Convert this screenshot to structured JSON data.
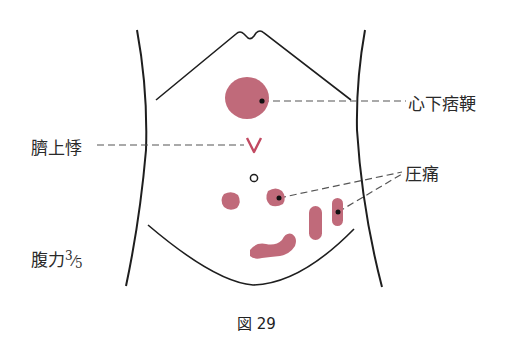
{
  "figure": {
    "caption": "図 29",
    "colors": {
      "finding_fill": "#c06a7a",
      "outline": "#1e1e1e",
      "leader_line": "#555555",
      "mark": "#c24a62"
    },
    "labels": {
      "shinka_hiko": "心下痞鞕",
      "seijo_ki": "臍上悸",
      "atsutsu": "圧痛",
      "fukuryoku_prefix": "腹力",
      "fukuryoku_num": "3",
      "fukuryoku_slash": "⁄",
      "fukuryoku_den": "5"
    }
  },
  "findings": [
    {
      "name": "epigastric-stiffness",
      "label": "心下痞鞕",
      "shape": "large circle"
    },
    {
      "name": "supraumbilical-pulsation",
      "label": "臍上悸",
      "shape": "V mark"
    },
    {
      "name": "navel",
      "label": "",
      "shape": "small open circle"
    },
    {
      "name": "tenderness",
      "label": "圧痛",
      "shape": "blobs with dots"
    },
    {
      "name": "abdominal-strength",
      "label": "腹力3/5",
      "shape": "text"
    }
  ]
}
